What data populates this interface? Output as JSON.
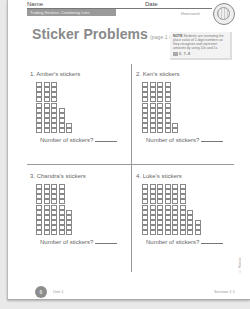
{
  "header": {
    "name_label": "Name",
    "date_label": "Date",
    "banner": "Trading Stickers, Combining Lists",
    "section": "Homework"
  },
  "title": {
    "main": "Sticker Problems",
    "sub": "(page 1 of 2)"
  },
  "note": {
    "label": "NOTE",
    "text": "Students are reviewing the place value of 2-digit numbers as they recognize and represent amounts by using 10s and 1s.",
    "ref_icon": "book-icon",
    "ref": "6, 7–8"
  },
  "problems": [
    {
      "number": "1.",
      "label": "Amber's stickers",
      "columns": [
        10,
        10,
        10,
        5,
        2
      ],
      "prompt": "Number of stickers?"
    },
    {
      "number": "2.",
      "label": "Ken's stickers",
      "columns": [
        10,
        10,
        10,
        10,
        2
      ],
      "prompt": "Number of stickers?"
    },
    {
      "number": "3.",
      "label": "Chandra's stickers",
      "columns": [
        10,
        10,
        10,
        10,
        5
      ],
      "prompt": "Number of stickers?"
    },
    {
      "number": "4.",
      "label": "Luke's stickers",
      "columns": [
        10,
        10,
        10,
        10,
        10,
        10,
        5,
        3
      ],
      "prompt": "Number of stickers?"
    }
  ],
  "footer": {
    "page_number": "6",
    "unit": "Unit 1",
    "session": "Session 1.1",
    "copyright": "© Pearson Education 2"
  }
}
